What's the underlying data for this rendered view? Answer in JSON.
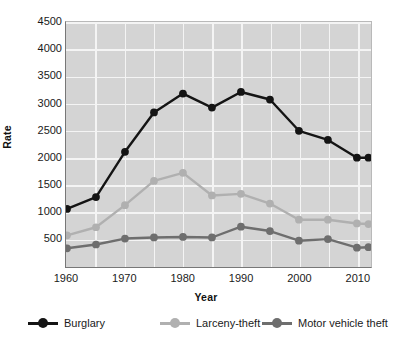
{
  "chart_data": {
    "type": "line",
    "title": "",
    "xlabel": "Year",
    "ylabel": "Rate",
    "x": [
      1960,
      1965,
      1970,
      1975,
      1980,
      1985,
      1990,
      1995,
      2000,
      2005,
      2010,
      2012
    ],
    "xlim": [
      1960,
      2012
    ],
    "ylim": [
      0,
      4500
    ],
    "ytick_labels": [
      "4500",
      "4000",
      "3500",
      "3000",
      "2500",
      "2000",
      "1500",
      "1000",
      "500"
    ],
    "yticks": [
      4500,
      4000,
      3500,
      3000,
      2500,
      2000,
      1500,
      1000,
      500
    ],
    "xtick_labels": [
      "1960",
      "1970",
      "1980",
      "1990",
      "2000",
      "2010"
    ],
    "xticks": [
      1960,
      1970,
      1980,
      1990,
      2000,
      2010
    ],
    "grid": true,
    "legend_position": "bottom",
    "plot_background": "#d4d4d4",
    "gridline_color": "#f4f4f4",
    "series": [
      {
        "name": "Burglary",
        "color": "#141414",
        "values": [
          1050,
          1270,
          2110,
          2840,
          3190,
          2930,
          3220,
          3080,
          2500,
          2330,
          2000,
          2000
        ]
      },
      {
        "name": "Larceny-theft",
        "color": "#b0b0b0",
        "values": [
          560,
          710,
          1120,
          1570,
          1720,
          1300,
          1330,
          1150,
          850,
          850,
          780,
          770
        ]
      },
      {
        "name": "Motor vehicle theft",
        "color": "#6e6e6e",
        "values": [
          320,
          390,
          500,
          520,
          530,
          520,
          720,
          640,
          460,
          490,
          330,
          340
        ]
      }
    ]
  }
}
